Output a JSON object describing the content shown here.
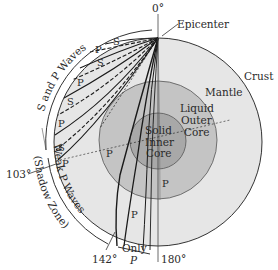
{
  "diagram": {
    "angles": {
      "top": "0°",
      "left": "103°",
      "bottom_left": "142°",
      "bottom": "180°"
    },
    "labels": {
      "epicenter": "Epicenter",
      "crust": "Crust",
      "mantle": "Mantle",
      "outer_core": [
        "Liquid",
        "Outer",
        "Core"
      ],
      "inner_core": [
        "Solid",
        "Inner",
        "Core"
      ],
      "s_and_p_waves": "S and P Waves",
      "weak_p_waves": "Weak P Waves",
      "shadow_zone": "(Shadow Zone)",
      "only_p": [
        "Only",
        "P"
      ]
    },
    "wave_labels": [
      "S",
      "P",
      "S",
      "P",
      "S",
      "P",
      "S",
      "P",
      "P",
      "P",
      "P"
    ],
    "colors": {
      "background": "#ffffff",
      "crust_mantle": "#e6e6e6",
      "outer_core": "#c4c4c4",
      "inner_core": "#a8a8a8",
      "lines": "#1a1a1a",
      "text": "#2a2a2a"
    }
  }
}
